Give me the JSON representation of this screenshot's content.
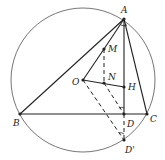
{
  "diagram": {
    "type": "geometry",
    "circle": {
      "center": "O",
      "cx": 83,
      "cy": 80,
      "r": 72
    },
    "points": {
      "A": {
        "label": "A",
        "x": 124,
        "y": 19
      },
      "B": {
        "label": "B",
        "x": 20,
        "y": 114
      },
      "C": {
        "label": "C",
        "x": 147,
        "y": 114
      },
      "D": {
        "label": "D",
        "x": 124,
        "y": 114
      },
      "Dp": {
        "label": "D'",
        "x": 124,
        "y": 140
      },
      "O": {
        "label": "O",
        "x": 83,
        "y": 80
      },
      "H": {
        "label": "H",
        "x": 124,
        "y": 87
      },
      "N": {
        "label": "N",
        "x": 104,
        "y": 83
      },
      "M": {
        "label": "M",
        "x": 104,
        "y": 49
      }
    },
    "solid_segments": [
      "AB",
      "AC",
      "BC",
      "AD",
      "OM",
      "OH"
    ],
    "dashed_segments": [
      "MN",
      "OD'",
      "ND'",
      "DD'"
    ],
    "angle_marks": [
      "at A",
      "at D",
      "at D'"
    ]
  }
}
